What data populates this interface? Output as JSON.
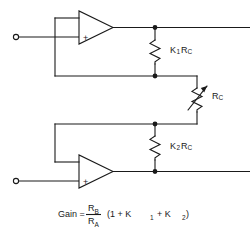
{
  "figure": {
    "type": "schematic",
    "stroke_color": "#1a1a1a",
    "background_color": "#ffffff"
  },
  "components": {
    "opamp_top": {
      "name": "top-op-amp",
      "plus_symbol": "+",
      "plus_input_position": "lower",
      "minus_input_position": "upper"
    },
    "opamp_bottom": {
      "name": "bottom-op-amp",
      "plus_symbol": "+",
      "plus_input_position": "lower",
      "minus_input_position": "upper"
    },
    "resistor_k1": {
      "label_main": "K",
      "label_sub": "1",
      "label_tail": "R",
      "label_tail_sub": "C",
      "full_label": "K1RC"
    },
    "resistor_k2": {
      "label_main": "K",
      "label_sub": "2",
      "label_tail": "R",
      "label_tail_sub": "C",
      "full_label": "K2RC"
    },
    "resistor_variable": {
      "label_main": "R",
      "label_sub": "C",
      "full_label": "RC",
      "variable": "true"
    },
    "terminal_top": {
      "name": "top-input-terminal"
    },
    "terminal_bottom": {
      "name": "bottom-input-terminal"
    }
  },
  "formula": {
    "lead": "Gain =",
    "numerator": "R",
    "numerator_sub": "B",
    "denominator": "R",
    "denominator_sub": "A",
    "open_paren": "(1  +  K",
    "k1_sub": "1",
    "plus_mid": "+  K",
    "k2_sub": "2",
    "close_paren": ")",
    "full_text": "Gain = RB / RA (1 + K1 + K2)"
  }
}
